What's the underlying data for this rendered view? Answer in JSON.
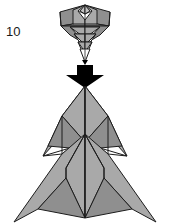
{
  "diagram": {
    "kind": "origami-folding-step",
    "step_number": "10",
    "step_number_name": "step-number-label",
    "background_color": "#ffffff",
    "ink_color": "#1c1c1c",
    "paper_front_color": "#a9a9a9",
    "paper_shadow_color": "#8f8f8f",
    "paper_highlight_color": "#c2c2c2",
    "paper_back_color": "#ffffff",
    "arrow": {
      "name": "fold-direction-arrow",
      "shape": "thick-block-arrow-down",
      "color": "#000000",
      "direction": "down",
      "meaning": "result-of-step"
    },
    "figures": [
      {
        "name": "before-figure",
        "label": "small folded model (before)",
        "position": "top",
        "description": "narrow layered shield/kite form with nested triangular flaps and a pointed bottom tip"
      },
      {
        "name": "after-figure",
        "label": "large opened model (after)",
        "position": "bottom",
        "description": "wide symmetric arrow-like form with four outward points and a central vertical spine"
      }
    ]
  }
}
